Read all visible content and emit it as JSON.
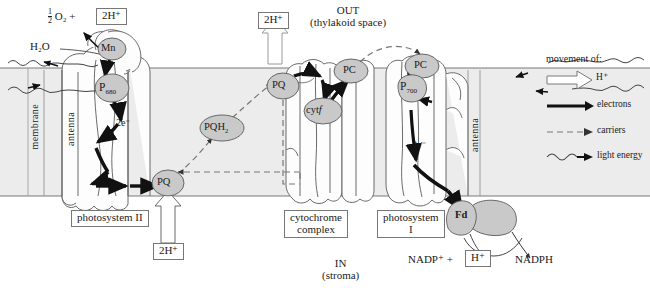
{
  "diagram": {
    "type": "biology-schematic"
  },
  "regions": {
    "out_line1": "OUT",
    "out_line2": "(thylakoid space)",
    "in_line1": "IN",
    "in_line2": "(stroma)",
    "membrane_label": "membrane"
  },
  "complexes": {
    "psii_label": "photosystem II",
    "cyt_label_line1": "cytochrome",
    "cyt_label_line2": "complex",
    "psi_label_line1": "photosystem",
    "psi_label_line2": "I",
    "antenna_left": "antenna",
    "antenna_right": "antenna"
  },
  "carriers": {
    "mn": "Mn",
    "p680_main": "P",
    "p680_sub": "680",
    "p700_main": "P",
    "p700_sub": "700",
    "pq_bottom": "PQ",
    "pqh2_main": "PQH",
    "pqh2_sub": "2",
    "pq_top": "PQ",
    "cytf_main": "cyt",
    "cytf_italic": "f",
    "pc_left": "PC",
    "pc_right": "PC",
    "fd": "Fd"
  },
  "reactants": {
    "water": "H₂O",
    "oxygen_frac_num": "1",
    "oxygen_frac_den": "2",
    "oxygen_species": "O₂",
    "oxygen_plus": "+",
    "two_h_top_left": "2H⁺",
    "two_h_top_center": "2H⁺",
    "two_h_bottom": "2H⁺",
    "nadp_plus": "NADP⁺  +",
    "h_plus_box": "H⁺",
    "nadph": "NADPH"
  },
  "electron_labels": {
    "psii_2e": "2e⁻",
    "psi_2e": "2e⁻"
  },
  "legend": {
    "heading": "movement of:",
    "items": [
      {
        "key": "proton",
        "icon": "hollow-arrow-icon",
        "label": "H⁺"
      },
      {
        "key": "electrons",
        "icon": "solid-arrow-icon",
        "label": "electrons"
      },
      {
        "key": "carriers",
        "icon": "dashed-arrow-icon",
        "label": "carriers"
      },
      {
        "key": "light",
        "icon": "wavy-arrow-icon",
        "label": "light energy"
      }
    ]
  },
  "colors": {
    "membrane_fill": "#ececec",
    "carrier_fill": "#c9c9c9",
    "outline": "#4a4a4a",
    "arrow_solid": "#111111",
    "background": "#ffffff"
  }
}
